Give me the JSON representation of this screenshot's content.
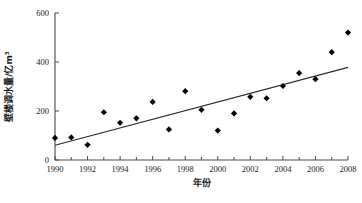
{
  "chart_data": {
    "type": "scatter",
    "title": "",
    "xlabel": "年份",
    "ylabel": "壁楼调水量/亿m³",
    "xlim": [
      1990,
      2008
    ],
    "ylim": [
      0,
      600
    ],
    "grid": false,
    "legend": null,
    "x": [
      1990,
      1991,
      1992,
      1993,
      1994,
      1995,
      1996,
      1997,
      1998,
      1999,
      2000,
      2001,
      2002,
      2003,
      2004,
      2005,
      2006,
      2007,
      2008
    ],
    "values": [
      90,
      92,
      62,
      195,
      152,
      170,
      237,
      125,
      281,
      205,
      120,
      190,
      258,
      252,
      302,
      355,
      330,
      440,
      520
    ],
    "series": [
      {
        "name": "调水量",
        "values": [
          90,
          92,
          62,
          195,
          152,
          170,
          237,
          125,
          281,
          205,
          120,
          190,
          258,
          252,
          302,
          355,
          330,
          440,
          520
        ]
      }
    ],
    "xticks": [
      1990,
      1992,
      1994,
      1996,
      1998,
      2000,
      2002,
      2004,
      2006,
      2008
    ],
    "xtick_labels": [
      "1990",
      "1992",
      "1994",
      "1996",
      "1998",
      "2000",
      "2002",
      "2004",
      "2006",
      "2008"
    ],
    "yticks": [
      0,
      200,
      400,
      600
    ],
    "ytick_labels": [
      "0",
      "200",
      "400",
      "600"
    ],
    "xtick_minor": [
      1991,
      1993,
      1995,
      1997,
      1999,
      2001,
      2003,
      2005,
      2007
    ],
    "trendline": {
      "x_start": 1990,
      "y_start": 60,
      "x_end": 2008,
      "y_end": 378
    },
    "marker": {
      "shape": "diamond",
      "color": "#000000",
      "size": 3.1
    },
    "colors": {
      "point": "#000000",
      "trend": "#2a2a2a",
      "axis": "#4a4a4a",
      "background": "#ffffff"
    }
  }
}
